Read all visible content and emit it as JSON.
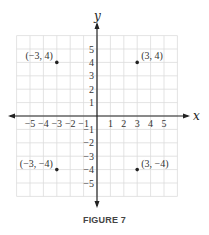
{
  "chart_data": {
    "type": "scatter",
    "title": "",
    "caption": "FIGURE 7",
    "xlabel": "x",
    "ylabel": "y",
    "xlim": [
      -6,
      6
    ],
    "ylim": [
      -6,
      6
    ],
    "grid": true,
    "x_tick_labels": [
      "−5",
      "−4",
      "−3",
      "−2",
      "−1",
      "1",
      "2",
      "3",
      "4",
      "5"
    ],
    "x_ticks": [
      -5,
      -4,
      -3,
      -2,
      -1,
      1,
      2,
      3,
      4,
      5
    ],
    "y_tick_labels": [
      "5",
      "4",
      "3",
      "2",
      "1",
      "−1",
      "−2",
      "−3",
      "−4",
      "−5"
    ],
    "y_ticks": [
      5,
      4,
      3,
      2,
      1,
      -1,
      -2,
      -3,
      -4,
      -5
    ],
    "points": [
      {
        "x": -3,
        "y": 4,
        "label": "(−3, 4)"
      },
      {
        "x": 3,
        "y": 4,
        "label": "(3, 4)"
      },
      {
        "x": -3,
        "y": -4,
        "label": "(−3, −4)"
      },
      {
        "x": 3,
        "y": -4,
        "label": "(3, −4)"
      }
    ]
  },
  "colors": {
    "grid": "#dcdcdc",
    "axis": "#222222",
    "point": "#222222",
    "text": "#333333"
  }
}
